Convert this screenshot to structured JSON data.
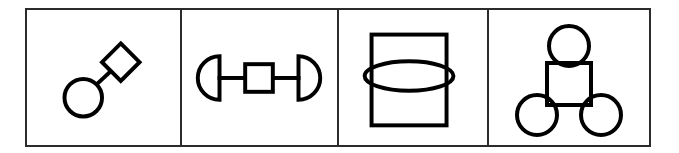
{
  "figure": {
    "background_color": "#ffffff",
    "stroke_color": "#000000",
    "frame_color": "#2b2b2b",
    "panel_count": 4
  },
  "panels": [
    {
      "id": "panel-1",
      "name": "circle-diamond-link",
      "caption": "",
      "shapes": [
        {
          "kind": "circle",
          "label": "circle",
          "cx": 57,
          "cy": 88,
          "r": 19
        },
        {
          "kind": "diamond",
          "label": "diamond",
          "cx": 95,
          "cy": 52,
          "half": 19
        },
        {
          "kind": "line",
          "label": "connector",
          "x1": 70,
          "y1": 75,
          "x2": 82,
          "y2": 64
        }
      ]
    },
    {
      "id": "panel-2",
      "name": "semicircles-square-barbell",
      "caption": "",
      "shapes": [
        {
          "kind": "semicircle",
          "label": "left-semicircle",
          "cx": 34,
          "cy": 68,
          "r": 22,
          "flat_side": "right"
        },
        {
          "kind": "line",
          "label": "left-connector",
          "x1": 34,
          "y1": 68,
          "x2": 62,
          "y2": 68
        },
        {
          "kind": "square",
          "label": "center-square",
          "x": 62,
          "y": 54,
          "w": 28,
          "h": 28
        },
        {
          "kind": "line",
          "label": "right-connector",
          "x1": 90,
          "y1": 68,
          "x2": 118,
          "y2": 68
        },
        {
          "kind": "semicircle",
          "label": "right-semicircle",
          "cx": 118,
          "cy": 68,
          "r": 22,
          "flat_side": "left"
        }
      ]
    },
    {
      "id": "panel-3",
      "name": "rectangle-with-ellipse",
      "caption": "",
      "shapes": [
        {
          "kind": "rect",
          "label": "tall-rectangle",
          "x": 33,
          "y": 24,
          "w": 74,
          "h": 90
        },
        {
          "kind": "ellipse",
          "label": "horizontal-ellipse",
          "cx": 70,
          "cy": 66,
          "rx": 44,
          "ry": 14
        }
      ]
    },
    {
      "id": "panel-4",
      "name": "square-with-three-circles",
      "caption": "",
      "shapes": [
        {
          "kind": "circle",
          "label": "top-circle",
          "cx": 77,
          "cy": 36,
          "r": 19
        },
        {
          "kind": "square",
          "label": "body-square",
          "x": 56,
          "y": 52,
          "w": 42,
          "h": 42
        },
        {
          "kind": "circle",
          "label": "bottom-left-circle",
          "cx": 45,
          "cy": 105,
          "r": 19
        },
        {
          "kind": "circle",
          "label": "bottom-right-circle",
          "cx": 109,
          "cy": 105,
          "r": 19
        }
      ]
    }
  ]
}
